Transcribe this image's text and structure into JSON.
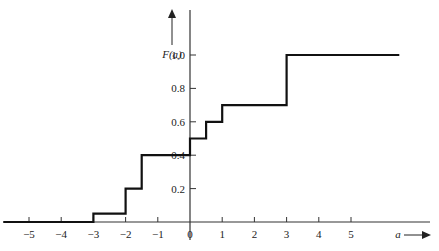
{
  "chart_data": {
    "type": "line",
    "subtype": "step",
    "title": "",
    "xlabel": "a",
    "ylabel": "F(a)",
    "x_ticks": [
      "-5",
      "-4",
      "-3",
      "-2",
      "-1",
      "0",
      "1",
      "2",
      "3",
      "4",
      "5"
    ],
    "y_ticks": [
      "0.2",
      "0.4",
      "0.6",
      "0.8",
      "1.0"
    ],
    "xlim": [
      -5.8,
      6.5
    ],
    "ylim": [
      0,
      1.2
    ],
    "steps": [
      {
        "x_start": -5.8,
        "x_end": -3,
        "y": 0
      },
      {
        "x_start": -3,
        "x_end": -2,
        "y": 0.05
      },
      {
        "x_start": -2,
        "x_end": -1.5,
        "y": 0.2
      },
      {
        "x_start": -1.5,
        "x_end": 0,
        "y": 0.4
      },
      {
        "x_start": 0,
        "x_end": 0.5,
        "y": 0.5
      },
      {
        "x_start": 0.5,
        "x_end": 1,
        "y": 0.6
      },
      {
        "x_start": 1,
        "x_end": 3,
        "y": 0.7
      },
      {
        "x_start": 3,
        "x_end": 6.5,
        "y": 1.0
      }
    ],
    "grid": false,
    "legend": null
  }
}
